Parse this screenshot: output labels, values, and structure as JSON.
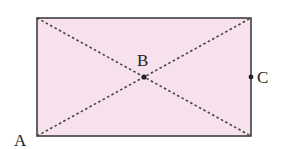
{
  "diagram": {
    "shape": "rectangle",
    "fill_color": "#f7e1ec",
    "stroke_color": "#333333",
    "diagonals": "dashed",
    "points": [
      {
        "label": "A",
        "position": "bottom-left corner"
      },
      {
        "label": "B",
        "position": "center (diagonal intersection)"
      },
      {
        "label": "C",
        "position": "midpoint of right side"
      }
    ]
  }
}
